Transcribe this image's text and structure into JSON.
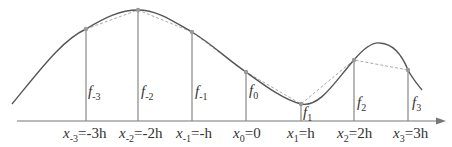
{
  "diagram": {
    "colors": {
      "curve": "#555555",
      "chord": "#aaaaaa",
      "stem": "#888888",
      "axis": "#777777",
      "text": "#333333"
    },
    "nodes": [
      {
        "f_label": "f",
        "f_sub": "-3",
        "x_label": "x",
        "x_sub": "-3",
        "x_value": "=-3h"
      },
      {
        "f_label": "f",
        "f_sub": "-2",
        "x_label": "x",
        "x_sub": "-2",
        "x_value": "=-2h"
      },
      {
        "f_label": "f",
        "f_sub": "-1",
        "x_label": "x",
        "x_sub": "-1",
        "x_value": "=-h"
      },
      {
        "f_label": "f",
        "f_sub": "0",
        "x_label": "x",
        "x_sub": "0",
        "x_value": "=0"
      },
      {
        "f_label": "f",
        "f_sub": "1",
        "x_label": "x",
        "x_sub": "1",
        "x_value": "=h"
      },
      {
        "f_label": "f",
        "f_sub": "2",
        "x_label": "x",
        "x_sub": "2",
        "x_value": "=2h"
      },
      {
        "f_label": "f",
        "f_sub": "3",
        "x_label": "x",
        "x_sub": "3",
        "x_value": "=3h"
      }
    ]
  }
}
